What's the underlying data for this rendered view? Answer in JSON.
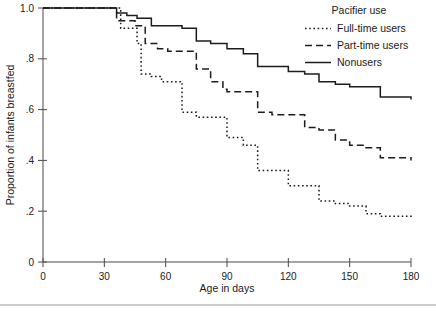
{
  "chart_data": {
    "type": "line",
    "subtype": "kaplan-meier-step",
    "title": "",
    "xlabel": "Age in days",
    "ylabel": "Proportion of infants breastfed",
    "xlim": [
      0,
      180
    ],
    "ylim": [
      0,
      1.0
    ],
    "xticks": [
      0,
      30,
      60,
      90,
      120,
      150,
      180
    ],
    "xtick_labels": [
      "0",
      "30",
      "60",
      "90",
      "120",
      "150",
      "180"
    ],
    "yticks": [
      0,
      0.2,
      0.4,
      0.6,
      0.8,
      1.0
    ],
    "ytick_labels": [
      "0",
      ".2",
      ".4",
      ".6",
      ".8",
      "1.0"
    ],
    "grid": false,
    "legend_position": "top-right",
    "legend_title": "Pacifier use",
    "series": [
      {
        "name": "Full-time users",
        "style": "dotted",
        "color": "#1c1c1c",
        "x": [
          0,
          30,
          38,
          43,
          46,
          48,
          53,
          58,
          61,
          68,
          75,
          80,
          90,
          98,
          105,
          112,
          120,
          128,
          135,
          143,
          150,
          158,
          165,
          180
        ],
        "y": [
          1.0,
          1.0,
          0.92,
          0.92,
          0.86,
          0.74,
          0.73,
          0.71,
          0.71,
          0.59,
          0.57,
          0.57,
          0.49,
          0.46,
          0.36,
          0.36,
          0.3,
          0.3,
          0.24,
          0.23,
          0.22,
          0.19,
          0.18,
          0.17
        ]
      },
      {
        "name": "Part-time users",
        "style": "dashed",
        "color": "#1c1c1c",
        "x": [
          0,
          30,
          36,
          41,
          45,
          50,
          56,
          61,
          68,
          75,
          82,
          88,
          90,
          98,
          105,
          112,
          120,
          128,
          135,
          143,
          150,
          158,
          165,
          180
        ],
        "y": [
          1.0,
          1.0,
          0.95,
          0.95,
          0.93,
          0.86,
          0.84,
          0.83,
          0.83,
          0.76,
          0.71,
          0.68,
          0.67,
          0.67,
          0.59,
          0.58,
          0.58,
          0.53,
          0.52,
          0.48,
          0.46,
          0.45,
          0.41,
          0.4
        ]
      },
      {
        "name": "Nonusers",
        "style": "solid",
        "color": "#1c1c1c",
        "x": [
          0,
          30,
          36,
          41,
          46,
          53,
          61,
          68,
          75,
          82,
          90,
          98,
          105,
          112,
          120,
          128,
          135,
          143,
          150,
          158,
          165,
          180
        ],
        "y": [
          1.0,
          1.0,
          0.98,
          0.97,
          0.96,
          0.93,
          0.93,
          0.92,
          0.87,
          0.86,
          0.84,
          0.82,
          0.77,
          0.77,
          0.75,
          0.74,
          0.71,
          0.7,
          0.69,
          0.69,
          0.65,
          0.64
        ]
      }
    ],
    "legend_entries": [
      {
        "label": "Full-time users",
        "style": "dotted"
      },
      {
        "label": "Part-time users",
        "style": "dashed"
      },
      {
        "label": "Nonusers",
        "style": "solid"
      }
    ]
  }
}
